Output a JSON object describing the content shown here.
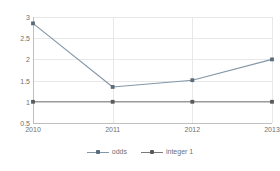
{
  "chart_data": {
    "type": "line",
    "title": "",
    "xlabel": "",
    "ylabel": "",
    "categories": [
      "2010",
      "2011",
      "2012",
      "2013"
    ],
    "x_tick_labels": [
      "2010",
      "2011",
      "2012",
      "2013"
    ],
    "y_tick_labels": [
      "3",
      "2.5",
      "2",
      "1.5",
      "1",
      "0.5"
    ],
    "y_tick_values": [
      3,
      2.5,
      2,
      1.5,
      1,
      0.5
    ],
    "ylim": [
      0.5,
      3
    ],
    "grid": true,
    "legend_position": "bottom",
    "series": [
      {
        "name": "odds",
        "values": [
          2.85,
          1.35,
          1.51,
          2.0
        ],
        "color": "#8497a8",
        "marker_color": "#5a6b7a"
      },
      {
        "name": "integer 1",
        "values": [
          1.0,
          1.0,
          1.0,
          1.0
        ],
        "color": "#7a7a7a",
        "marker_color": "#5a5a5a"
      }
    ]
  },
  "legend": {
    "entries": [
      {
        "label": "odds"
      },
      {
        "label": "integer 1"
      }
    ]
  },
  "colors": {
    "grid": "#e8e8e8",
    "axis": "#bfbfbf",
    "text": "#6f6f6f",
    "background": "#ffffff",
    "series_odds": "#8497a8",
    "series_integer1": "#7a7a7a"
  }
}
